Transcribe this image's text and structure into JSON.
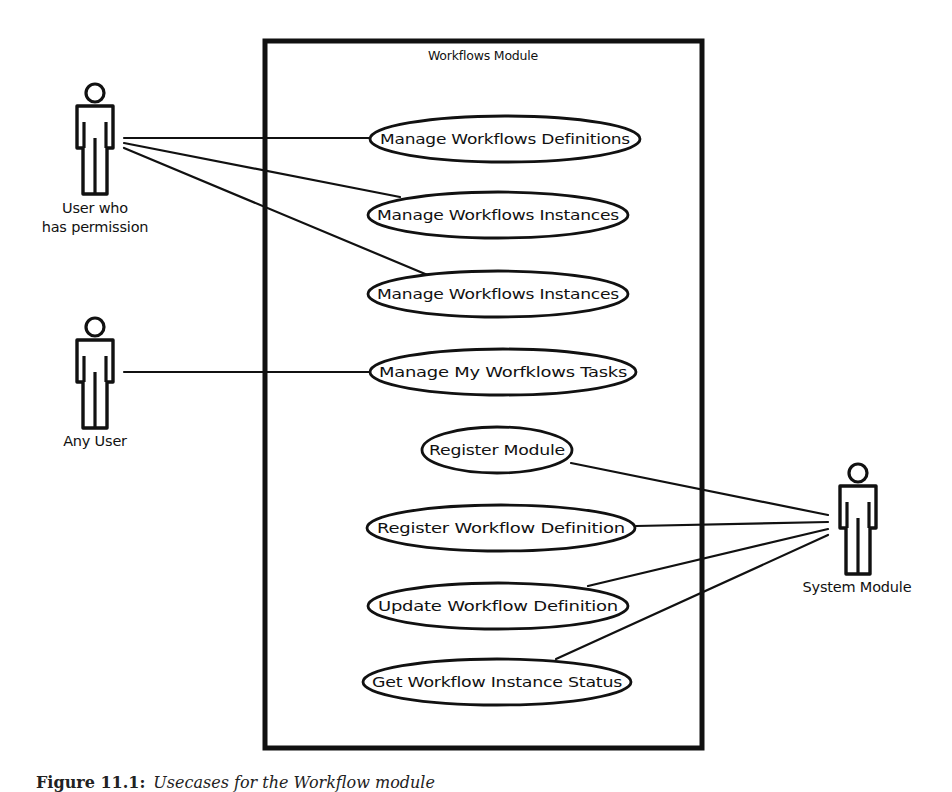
{
  "diagram": {
    "type": "uml-use-case",
    "system_boundary": {
      "title": "Workflows Module"
    },
    "use_cases": [
      {
        "id": "uc1",
        "label": "Manage Workflows Definitions"
      },
      {
        "id": "uc2",
        "label": "Manage Workflows Instances"
      },
      {
        "id": "uc3",
        "label": "Manage Workflows Instances"
      },
      {
        "id": "uc4",
        "label": "Manage My Worfklows Tasks"
      },
      {
        "id": "uc5",
        "label": "Register Module"
      },
      {
        "id": "uc6",
        "label": "Register Workflow Definition"
      },
      {
        "id": "uc7",
        "label": "Update Workflow Definition"
      },
      {
        "id": "uc8",
        "label": "Get Workflow Instance Status"
      }
    ],
    "actors": [
      {
        "id": "a1",
        "label_line1": "User who",
        "label_line2": "has permission"
      },
      {
        "id": "a2",
        "label_line1": "Any User"
      },
      {
        "id": "a3",
        "label_line1": "System Module"
      }
    ],
    "associations": [
      {
        "from": "a1",
        "to": "uc1"
      },
      {
        "from": "a1",
        "to": "uc2"
      },
      {
        "from": "a1",
        "to": "uc3"
      },
      {
        "from": "a2",
        "to": "uc4"
      },
      {
        "from": "a3",
        "to": "uc5"
      },
      {
        "from": "a3",
        "to": "uc6"
      },
      {
        "from": "a3",
        "to": "uc7"
      },
      {
        "from": "a3",
        "to": "uc8"
      }
    ],
    "colors": {
      "stroke": "#111111",
      "background": "#ffffff"
    }
  },
  "caption": {
    "figure_label": "Figure 11.1:",
    "text": "Usecases for the Workflow module"
  }
}
